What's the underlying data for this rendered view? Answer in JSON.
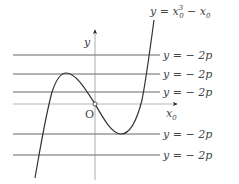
{
  "diagram": {
    "curve_label": {
      "lhs": "y",
      "eq": " = ",
      "var": "x",
      "sub": "0",
      "sup": "3",
      "minus": " − ",
      "var2": "x",
      "sub2": "0"
    },
    "y_axis_label": "y",
    "x_axis_label": {
      "var": "x",
      "sub": "0"
    },
    "origin_label": "O",
    "lines": [
      {
        "label": "y = − 2p"
      },
      {
        "label": "y = − 2p"
      },
      {
        "label": "y = − 2p"
      },
      {
        "label": "y = − 2p"
      },
      {
        "label": "y = − 2p"
      }
    ],
    "colors": {
      "curve": "#333333",
      "lines": "#555555",
      "axes": "#777777",
      "text": "#444444"
    }
  }
}
